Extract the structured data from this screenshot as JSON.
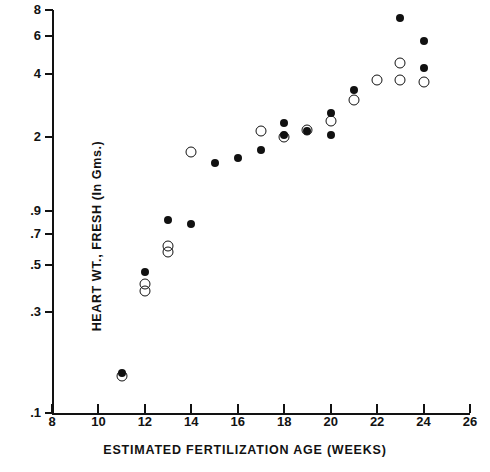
{
  "chart_data": {
    "type": "scatter",
    "title": "",
    "xlabel": "ESTIMATED FERTILIZATION AGE (WEEKS)",
    "ylabel": "HEART WT., FRESH (In Gms.)",
    "xlim": [
      8,
      26
    ],
    "ylim": [
      0.1,
      8
    ],
    "yscale": "log",
    "xscale": "linear",
    "grid": false,
    "legend": "none",
    "xticks": [
      8,
      10,
      12,
      14,
      16,
      18,
      20,
      22,
      24,
      26
    ],
    "xticklabels": [
      "8",
      "10",
      "12",
      "14",
      "16",
      "18",
      "20",
      "22",
      "24",
      "26"
    ],
    "yticks": [
      0.1,
      0.3,
      0.5,
      0.7,
      0.9,
      2,
      4,
      6,
      8
    ],
    "yticklabels": [
      ".1",
      ".3",
      ".5",
      ".7",
      ".9",
      "2",
      "4",
      "6",
      "8"
    ],
    "series": [
      {
        "name": "filled",
        "marker": "filled-circle",
        "color": "#111111",
        "points": [
          {
            "x": 11.0,
            "y": 0.155
          },
          {
            "x": 12.0,
            "y": 0.465
          },
          {
            "x": 13.0,
            "y": 0.815
          },
          {
            "x": 14.0,
            "y": 0.785
          },
          {
            "x": 15.0,
            "y": 1.52
          },
          {
            "x": 16.0,
            "y": 1.6
          },
          {
            "x": 17.0,
            "y": 1.75
          },
          {
            "x": 18.0,
            "y": 2.35
          },
          {
            "x": 18.0,
            "y": 2.05
          },
          {
            "x": 19.0,
            "y": 2.15
          },
          {
            "x": 20.0,
            "y": 2.6
          },
          {
            "x": 20.0,
            "y": 2.05
          },
          {
            "x": 21.0,
            "y": 3.35
          },
          {
            "x": 23.0,
            "y": 7.3
          },
          {
            "x": 24.0,
            "y": 5.7
          },
          {
            "x": 24.0,
            "y": 4.25
          }
        ]
      },
      {
        "name": "open",
        "marker": "open-circle",
        "color": "#111111",
        "points": [
          {
            "x": 11.0,
            "y": 0.15
          },
          {
            "x": 12.0,
            "y": 0.405
          },
          {
            "x": 12.0,
            "y": 0.378
          },
          {
            "x": 13.0,
            "y": 0.615
          },
          {
            "x": 13.0,
            "y": 0.575
          },
          {
            "x": 14.0,
            "y": 1.7
          },
          {
            "x": 17.0,
            "y": 2.15
          },
          {
            "x": 18.0,
            "y": 2.02
          },
          {
            "x": 19.0,
            "y": 2.18
          },
          {
            "x": 20.0,
            "y": 2.4
          },
          {
            "x": 21.0,
            "y": 3.0
          },
          {
            "x": 22.0,
            "y": 3.75
          },
          {
            "x": 23.0,
            "y": 4.5
          },
          {
            "x": 23.0,
            "y": 3.72
          },
          {
            "x": 24.0,
            "y": 3.65
          }
        ]
      }
    ]
  }
}
